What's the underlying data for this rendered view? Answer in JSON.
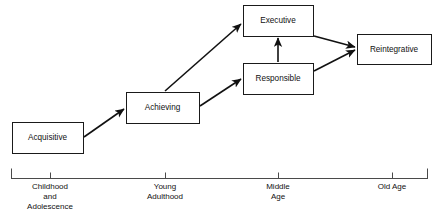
{
  "diagram": {
    "type": "flow-diagram",
    "stroke_color": "#111111",
    "box_fill_color": "#ffffff",
    "axis_color": "#4a4a4a",
    "stages": [
      {
        "id": "acquisitive",
        "label": "Acquisitive",
        "x": 12,
        "y": 122,
        "w": 71,
        "h": 31
      },
      {
        "id": "achieving",
        "label": "Achieving",
        "x": 126,
        "y": 92,
        "w": 73,
        "h": 31
      },
      {
        "id": "executive",
        "label": "Executive",
        "x": 243,
        "y": 5,
        "w": 70,
        "h": 31
      },
      {
        "id": "responsible",
        "label": "Responsible",
        "x": 243,
        "y": 63,
        "w": 70,
        "h": 31
      },
      {
        "id": "reintegrative",
        "label": "Reintegrative",
        "x": 357,
        "y": 34,
        "w": 74,
        "h": 30
      }
    ],
    "connections": [
      {
        "id": "acquisitive-to-achieving",
        "from": "acquisitive",
        "to": "achieving",
        "x1": 84,
        "y1": 137,
        "x2": 124,
        "y2": 109
      },
      {
        "id": "achieving-to-executive",
        "from": "achieving",
        "to": "executive",
        "x1": 165,
        "y1": 91,
        "x2": 241,
        "y2": 24
      },
      {
        "id": "achieving-to-responsible",
        "from": "achieving",
        "to": "responsible",
        "x1": 200,
        "y1": 106,
        "x2": 241,
        "y2": 79
      },
      {
        "id": "responsible-to-executive",
        "from": "responsible",
        "to": "executive",
        "x1": 278,
        "y1": 62,
        "x2": 278,
        "y2": 38
      },
      {
        "id": "executive-to-reintegrative",
        "from": "executive",
        "to": "reintegrative",
        "x1": 314,
        "y1": 36,
        "x2": 355,
        "y2": 47
      },
      {
        "id": "responsible-to-reintegrative",
        "from": "responsible",
        "to": "reintegrative",
        "x1": 314,
        "y1": 71,
        "x2": 355,
        "y2": 50
      }
    ],
    "timeline": {
      "id": "life-span-axis",
      "y": 178,
      "x_start": 11,
      "x_end": 428,
      "cap_height": 10,
      "tick_height": 6,
      "ticks": [
        {
          "id": "tick-childhood",
          "x": 50,
          "lines": [
            "Childhood",
            "and",
            "Adolescence"
          ]
        },
        {
          "id": "tick-young-adult",
          "x": 165,
          "lines": [
            "Young",
            "Adulthood"
          ]
        },
        {
          "id": "tick-middle-age",
          "x": 278,
          "lines": [
            "Middle",
            "Age"
          ]
        },
        {
          "id": "tick-old-age",
          "x": 392,
          "lines": [
            "Old Age"
          ]
        }
      ]
    }
  }
}
